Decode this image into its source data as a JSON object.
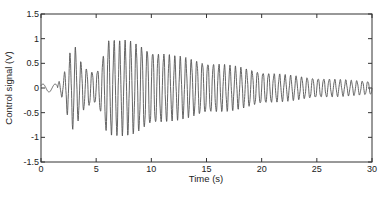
{
  "chart_data": {
    "type": "line",
    "title": "",
    "xlabel": "Time (s)",
    "ylabel": "Control signal (V)",
    "xlim": [
      0,
      30
    ],
    "ylim": [
      -1.5,
      1.5
    ],
    "xticks": [
      0,
      5,
      10,
      15,
      20,
      25,
      30
    ],
    "yticks": [
      -1.5,
      -1,
      -0.5,
      0,
      0.5,
      1,
      1.5
    ],
    "grid": false,
    "legend": null,
    "line_color": "#555555",
    "series": [
      {
        "name": "Control signal",
        "description": "Oscillatory control signal ~2 Hz; small slow wiggle 0-1.5 s, large oscillations (peak ~±1.0 V) around 2-10 s, then amplitude decays to ~±0.15 V by 30 s",
        "frequency_hz": 2.0,
        "envelope": {
          "t": [
            0,
            1.5,
            2.0,
            2.5,
            3.0,
            3.5,
            4.0,
            4.5,
            5.0,
            5.5,
            6.0,
            7.0,
            8.0,
            9.0,
            10.0,
            12.0,
            14.0,
            16.0,
            18.0,
            20.0,
            22.0,
            24.0,
            26.0,
            28.0,
            30.0
          ],
          "amp": [
            0.08,
            0.1,
            0.2,
            0.6,
            0.85,
            0.55,
            0.4,
            0.35,
            0.3,
            0.55,
            0.95,
            0.9,
            0.9,
            0.85,
            0.75,
            0.62,
            0.55,
            0.48,
            0.4,
            0.32,
            0.26,
            0.21,
            0.18,
            0.15,
            0.13
          ]
        }
      }
    ]
  },
  "labels": {
    "xlabel": "Time (s)",
    "ylabel": "Control signal (V)",
    "xtick_labels": [
      "0",
      "5",
      "10",
      "15",
      "20",
      "25",
      "30"
    ],
    "ytick_labels": [
      "-1.5",
      "-1",
      "-0.5",
      "0",
      "0.5",
      "1",
      "1.5"
    ]
  }
}
